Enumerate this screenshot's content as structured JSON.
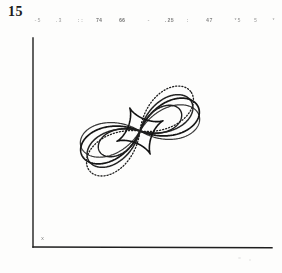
{
  "page": {
    "number": "15",
    "background_color": "#fdfdfc",
    "ink_color": "#1a1a1a"
  },
  "header": {
    "annotations": [
      "-5",
      ".3",
      "::",
      "74",
      "66",
      "-",
      ".25",
      ":",
      "47",
      "*5",
      "5",
      "*"
    ]
  },
  "axes": {
    "origin_label": "x",
    "x_axis": {
      "from_px": 33,
      "to_px": 272,
      "y_px": 247
    },
    "y_axis": {
      "from_px": 38,
      "to_px": 247,
      "x_px": 33
    },
    "line_color": "#1f1f1f"
  },
  "chart_data": {
    "type": "line",
    "title": "",
    "subtitle": "",
    "xlabel": "x",
    "ylabel": "",
    "grid": false,
    "legend_position": "none",
    "coordinate_system": "polar",
    "center_px": [
      140,
      131
    ],
    "xlim": [
      -1.25,
      1.25
    ],
    "ylim": [
      -1.25,
      1.25
    ],
    "series": [
      {
        "name": "rose-outer-solid-1",
        "style": "solid",
        "stroke_width": 1.7,
        "color": "#161616",
        "type": "rose",
        "petals": 4,
        "amplitude": 1.0,
        "rotation_deg": 22,
        "aspect": [
          1.0,
          1.0
        ]
      },
      {
        "name": "rose-outer-solid-2",
        "style": "solid",
        "stroke_width": 1.5,
        "color": "#242424",
        "type": "rose",
        "petals": 4,
        "amplitude": 0.94,
        "rotation_deg": 30,
        "aspect": [
          1.0,
          1.0
        ]
      },
      {
        "name": "rose-outer-solid-3",
        "style": "solid",
        "stroke_width": 1.2,
        "color": "#3a3a3a",
        "type": "rose",
        "petals": 4,
        "amplitude": 0.97,
        "rotation_deg": 14,
        "aspect": [
          1.0,
          1.0
        ]
      },
      {
        "name": "rose-outer-dotted",
        "style": "dotted",
        "stroke_width": 1.3,
        "color": "#1c1c1c",
        "type": "rose",
        "petals": 4,
        "amplitude": 1.02,
        "rotation_deg": 38,
        "aspect": [
          1.0,
          1.0
        ]
      },
      {
        "name": "rose-mid-solid",
        "style": "solid",
        "stroke_width": 1.4,
        "color": "#1f1f1f",
        "type": "rose",
        "petals": 4,
        "amplitude": 0.72,
        "rotation_deg": 26,
        "aspect": [
          1.0,
          1.0
        ]
      },
      {
        "name": "astroid-inner-star",
        "style": "solid",
        "stroke_width": 1.6,
        "color": "#121212",
        "type": "astroid",
        "cusps": 4,
        "amplitude": 0.4,
        "rotation_deg": 24
      }
    ]
  }
}
